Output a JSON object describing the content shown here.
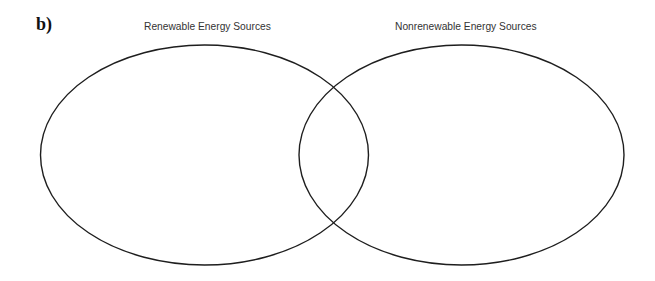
{
  "diagram": {
    "part_label": "b)",
    "type": "venn",
    "sets": [
      {
        "title": "Renewable Energy Sources",
        "contents": []
      },
      {
        "title": "Nonrenewable Energy Sources",
        "contents": []
      }
    ],
    "overlap_contents": [],
    "colors": {
      "stroke": "#1e1e1e",
      "title_text": "#333333",
      "part_label_text": "#111111",
      "background": "#ffffff"
    }
  }
}
